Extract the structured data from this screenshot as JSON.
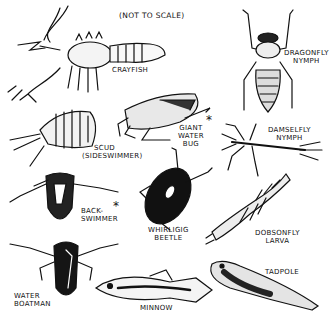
{
  "title_note": "(NOT TO SCALE)",
  "colors": {
    "ink": "#111111",
    "paper": "#ffffff"
  },
  "animals": [
    {
      "id": "crayfish",
      "label": "CRAYFISH",
      "marked": false
    },
    {
      "id": "dragonfly-nymph",
      "label_line1": "DRAGONFLY",
      "label_line2": "NYMPH",
      "marked": false
    },
    {
      "id": "scud",
      "label_line1": "SCUD",
      "label_line2": "(SIDESWIMMER)",
      "marked": false
    },
    {
      "id": "giant-water-bug",
      "label_line1": "GIANT",
      "label_line2": "WATER",
      "label_line3": "BUG",
      "marked": true
    },
    {
      "id": "damselfly-nymph",
      "label_line1": "DAMSELFLY",
      "label_line2": "NYMPH",
      "marked": false
    },
    {
      "id": "backswimmer",
      "label_line1": "BACK-",
      "label_line2": "SWIMMER",
      "marked": true
    },
    {
      "id": "whirligig-beetle",
      "label_line1": "WHIRLIGIG",
      "label_line2": "BEETLE",
      "marked": false
    },
    {
      "id": "dobsonfly-larva",
      "label_line1": "DOBSONFLY",
      "label_line2": "LARVA",
      "marked": false
    },
    {
      "id": "water-boatman",
      "label_line1": "WATER",
      "label_line2": "BOATMAN",
      "marked": false
    },
    {
      "id": "minnow",
      "label": "MINNOW",
      "marked": false
    },
    {
      "id": "tadpole",
      "label": "TADPOLE",
      "marked": false
    }
  ],
  "marker_symbol": "*"
}
